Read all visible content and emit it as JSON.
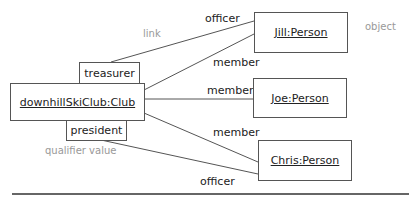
{
  "diagram": {
    "type": "uml-object-diagram",
    "objects": [
      {
        "id": "club",
        "label": "downhillSkiClub:Club"
      },
      {
        "id": "jill",
        "label": "Jill:Person"
      },
      {
        "id": "joe",
        "label": "Joe:Person"
      },
      {
        "id": "chris",
        "label": "Chris:Person"
      }
    ],
    "qualifiers": [
      {
        "id": "treasurer",
        "label": "treasurer"
      },
      {
        "id": "president",
        "label": "president"
      }
    ],
    "links": [
      {
        "from": "treasurer",
        "to": "jill",
        "role": "officer"
      },
      {
        "from": "club",
        "to": "jill",
        "role": "member"
      },
      {
        "from": "club",
        "to": "joe",
        "role": "member"
      },
      {
        "from": "club",
        "to": "chris",
        "role": "member"
      },
      {
        "from": "president",
        "to": "chris",
        "role": "officer"
      }
    ],
    "annotations": {
      "link": "link",
      "object": "object",
      "qualifier_value": "qualifier value"
    },
    "colors": {
      "line": "#555555",
      "text": "#222222",
      "annotation": "#999999"
    }
  }
}
